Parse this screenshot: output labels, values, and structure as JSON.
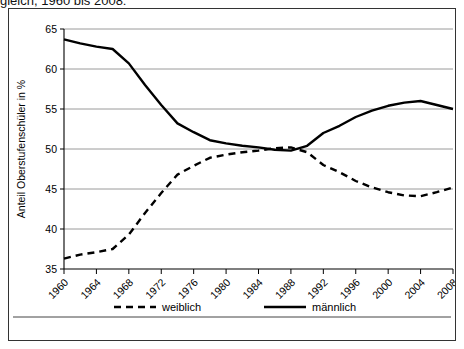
{
  "caption": "gleich, 1960 bis 2008:",
  "chart_data": {
    "type": "line",
    "title": "",
    "xlabel": "",
    "ylabel": "Anteil Oberstufenschüler in %",
    "ylim": [
      35,
      65
    ],
    "yticks": [
      35,
      40,
      45,
      50,
      55,
      60,
      65
    ],
    "xlim": [
      1960,
      2008
    ],
    "grid": true,
    "legend_position": "bottom",
    "categories": [
      1960,
      1962,
      1964,
      1966,
      1968,
      1970,
      1972,
      1974,
      1976,
      1978,
      1980,
      1982,
      1984,
      1986,
      1988,
      1990,
      1992,
      1994,
      1996,
      1998,
      2000,
      2002,
      2004,
      2006,
      2008
    ],
    "xticks": [
      1960,
      1964,
      1968,
      1972,
      1976,
      1980,
      1984,
      1988,
      1992,
      1996,
      2000,
      2004,
      2008
    ],
    "xticklabels": [
      "1960",
      "1964",
      "1968",
      "1972",
      "1976",
      "1980",
      "1984",
      "1988",
      "1992",
      "1996",
      "2000",
      "2004",
      "2008"
    ],
    "series": [
      {
        "name": "weiblich",
        "style": "dashed",
        "color": "#000000",
        "values": [
          36.3,
          36.8,
          37.1,
          37.5,
          39.3,
          42.0,
          44.5,
          46.8,
          47.9,
          48.9,
          49.3,
          49.6,
          49.8,
          50.1,
          50.2,
          49.6,
          48.0,
          47.1,
          46.0,
          45.2,
          44.6,
          44.2,
          44.1,
          44.6,
          45.2
        ]
      },
      {
        "name": "männlich",
        "style": "solid",
        "color": "#000000",
        "values": [
          63.7,
          63.2,
          62.8,
          62.5,
          60.7,
          58.0,
          55.5,
          53.2,
          52.1,
          51.1,
          50.7,
          50.4,
          50.2,
          49.9,
          49.8,
          50.4,
          52.0,
          52.9,
          54.0,
          54.8,
          55.4,
          55.8,
          56.0,
          55.5,
          55.0
        ]
      }
    ],
    "legend": [
      {
        "label": "weiblich",
        "style": "dashed"
      },
      {
        "label": "männlich",
        "style": "solid"
      }
    ]
  }
}
